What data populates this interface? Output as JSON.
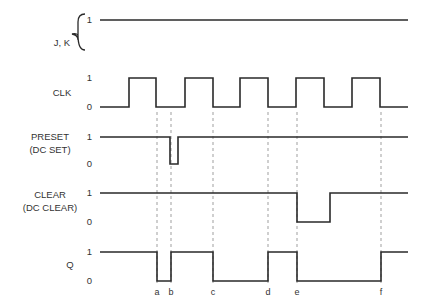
{
  "signals": [
    {
      "id": "jk",
      "label_lines": [
        "J, K"
      ],
      "levels": [
        "1"
      ],
      "brace": true,
      "transitions": [],
      "initial": 1
    },
    {
      "id": "clk",
      "label_lines": [
        "CLK"
      ],
      "levels": [
        "1",
        "0"
      ],
      "initial": 0,
      "transitions": [
        129,
        156,
        185,
        213,
        240,
        268,
        296,
        324,
        352,
        380
      ]
    },
    {
      "id": "preset",
      "label_lines": [
        "PRESET",
        "(DC SET)"
      ],
      "levels": [
        "1",
        "0"
      ],
      "initial": 1,
      "transitions": [
        170,
        178
      ]
    },
    {
      "id": "clear",
      "label_lines": [
        "CLEAR",
        "(DC CLEAR)"
      ],
      "levels": [
        "1",
        "0"
      ],
      "initial": 1,
      "transitions": [
        297,
        330
      ]
    },
    {
      "id": "q",
      "label_lines": [
        "Q"
      ],
      "levels": [
        "1",
        "0"
      ],
      "initial": 1,
      "transitions": [
        157,
        171,
        213,
        268,
        297,
        381
      ]
    }
  ],
  "markers": [
    {
      "label": "a",
      "t": 157
    },
    {
      "label": "b",
      "t": 171
    },
    {
      "label": "c",
      "t": 213
    },
    {
      "label": "d",
      "t": 268
    },
    {
      "label": "e",
      "t": 297
    },
    {
      "label": "f",
      "t": 381
    }
  ],
  "time_range": [
    100,
    408
  ]
}
